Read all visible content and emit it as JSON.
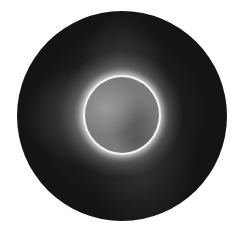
{
  "image": {
    "subject": "solar corona with occulted disk",
    "colors": {
      "background": "#ffffff",
      "field": "#141414",
      "ring": "#f4f4f4",
      "disk": "#7a7a7a"
    }
  }
}
